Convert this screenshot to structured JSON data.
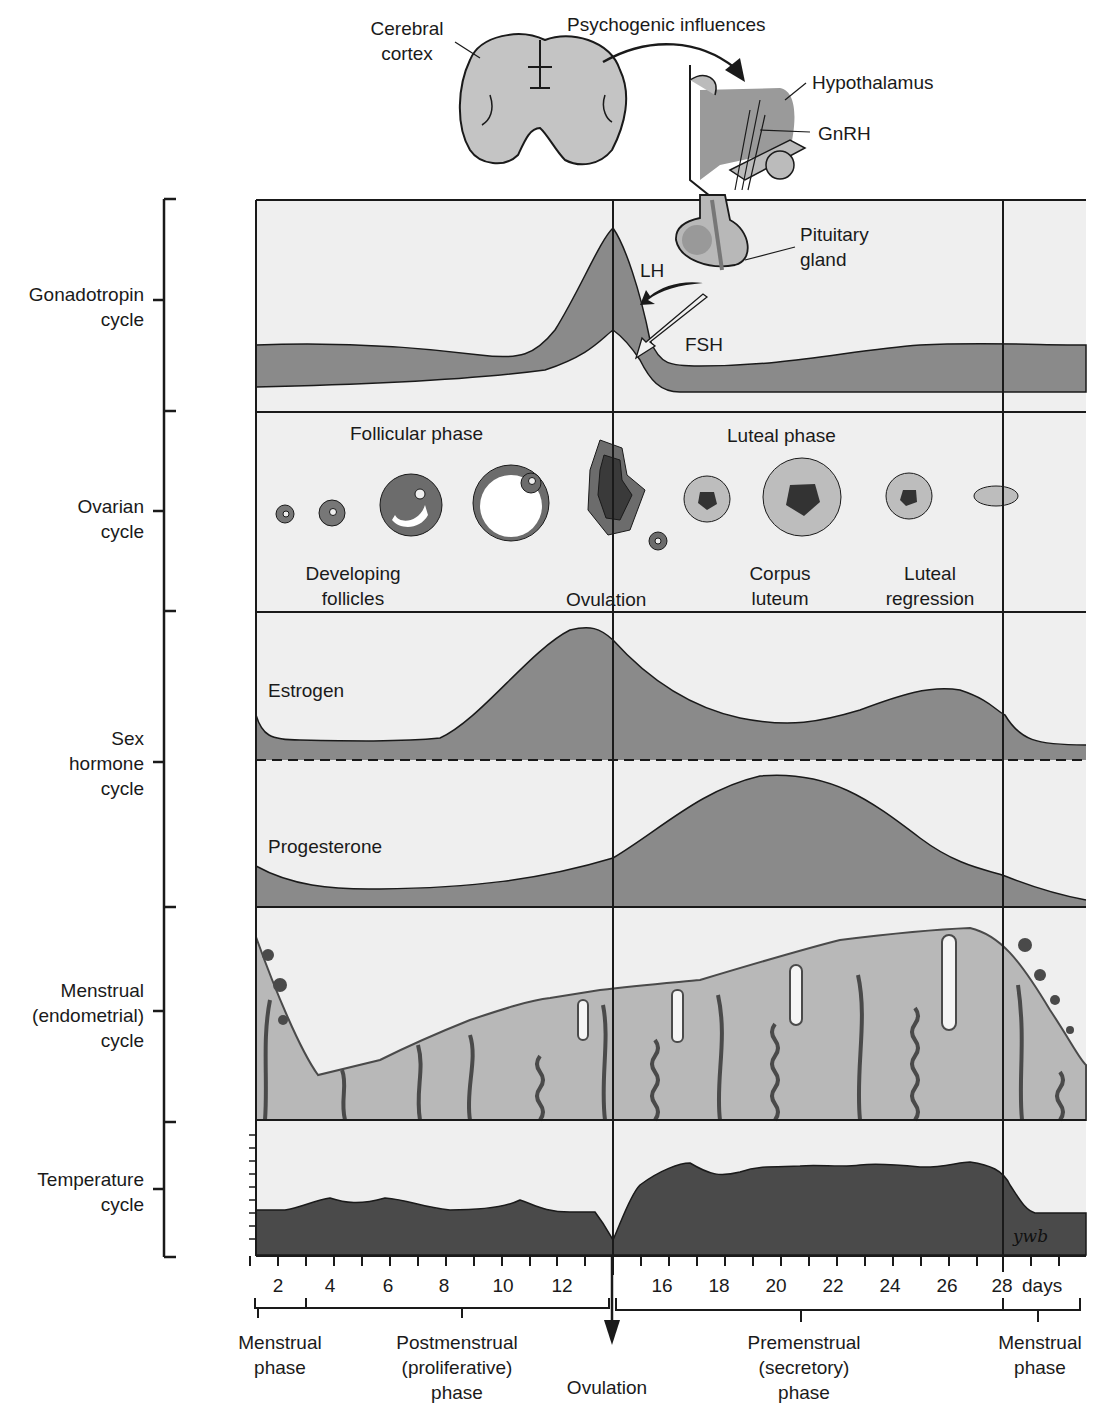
{
  "header": {
    "cerebral_cortex": [
      "Cerebral",
      "cortex"
    ],
    "psychogenic": "Psychogenic influences",
    "hypothalamus": "Hypothalamus",
    "gnrh": "GnRH",
    "pituitary": [
      "Pituitary",
      "gland"
    ],
    "lh": "LH",
    "fsh": "FSH"
  },
  "rows": [
    {
      "id": "gonadotropin",
      "label": [
        "Gonadotropin",
        "cycle"
      ]
    },
    {
      "id": "ovarian",
      "label": [
        "Ovarian",
        "cycle"
      ]
    },
    {
      "id": "sex-hormone",
      "label": [
        "Sex",
        "hormone",
        "cycle"
      ]
    },
    {
      "id": "menstrual",
      "label": [
        "Menstrual",
        "(endometrial)",
        "cycle"
      ]
    },
    {
      "id": "temperature",
      "label": [
        "Temperature",
        "cycle"
      ]
    }
  ],
  "ovarian": {
    "follicular_phase": "Follicular phase",
    "luteal_phase": "Luteal phase",
    "developing_follicles": [
      "Developing",
      "follicles"
    ],
    "ovulation": "Ovulation",
    "corpus_luteum": [
      "Corpus",
      "luteum"
    ],
    "luteal_regression": [
      "Luteal",
      "regression"
    ]
  },
  "hormones": {
    "estrogen": "Estrogen",
    "progesterone": "Progesterone"
  },
  "signature": "ywb",
  "x_axis": {
    "ticks": [
      "2",
      "4",
      "6",
      "8",
      "10",
      "12",
      "16",
      "18",
      "20",
      "22",
      "24",
      "26",
      "28"
    ],
    "unit": "days"
  },
  "phases": {
    "menstrual_1": [
      "Menstrual",
      "phase"
    ],
    "postmenstrual": [
      "Postmenstrual",
      "(proliferative)",
      "phase"
    ],
    "ovulation": "Ovulation",
    "premenstrual": [
      "Premenstrual",
      "(secretory)",
      "phase"
    ],
    "menstrual_2": [
      "Menstrual",
      "phase"
    ]
  },
  "colors": {
    "panel_bg": "#eeeeee",
    "mid_gray": "#8a8a8a",
    "light_gray": "#b8b8b8",
    "dark_gray": "#4a4a4a",
    "line": "#1a1a1a"
  }
}
